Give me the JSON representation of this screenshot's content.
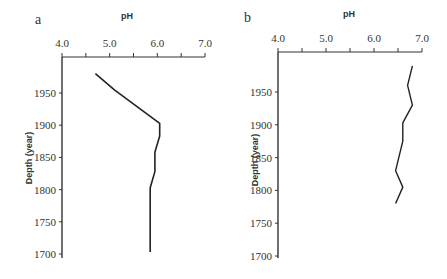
{
  "chart_data": [
    {
      "type": "line",
      "panel_label": "a",
      "title": "",
      "xlabel": "pH",
      "ylabel": "Depth (year)",
      "xlim": [
        4.0,
        7.0
      ],
      "ylim": [
        1700,
        1990
      ],
      "x_ticks": [
        "4.0",
        "5.0",
        "6.0",
        "7.0"
      ],
      "y_ticks": [
        "1950",
        "1900",
        "1850",
        "1800",
        "1750",
        "1700"
      ],
      "grid": false,
      "legend": null,
      "series": [
        {
          "name": "pH profile a",
          "points": [
            {
              "pH": 4.7,
              "year": 1980
            },
            {
              "pH": 5.1,
              "year": 1955
            },
            {
              "pH": 6.05,
              "year": 1903
            },
            {
              "pH": 6.05,
              "year": 1883
            },
            {
              "pH": 5.95,
              "year": 1858
            },
            {
              "pH": 5.95,
              "year": 1828
            },
            {
              "pH": 5.85,
              "year": 1803
            },
            {
              "pH": 5.85,
              "year": 1703
            }
          ]
        }
      ]
    },
    {
      "type": "line",
      "panel_label": "b",
      "title": "",
      "xlabel": "pH",
      "ylabel": "Depth (year)",
      "xlim": [
        4.0,
        7.0
      ],
      "ylim": [
        1700,
        1990
      ],
      "x_ticks": [
        "4.0",
        "5.0",
        "6.0",
        "7.0"
      ],
      "y_ticks": [
        "1950",
        "1900",
        "1850",
        "1800",
        "1750",
        "1700"
      ],
      "grid": false,
      "legend": null,
      "series": [
        {
          "name": "pH profile b",
          "points": [
            {
              "pH": 6.8,
              "year": 1990
            },
            {
              "pH": 6.7,
              "year": 1960
            },
            {
              "pH": 6.8,
              "year": 1930
            },
            {
              "pH": 6.6,
              "year": 1903
            },
            {
              "pH": 6.6,
              "year": 1875
            },
            {
              "pH": 6.45,
              "year": 1830
            },
            {
              "pH": 6.6,
              "year": 1805
            },
            {
              "pH": 6.45,
              "year": 1780
            }
          ]
        }
      ]
    }
  ],
  "panels": {
    "a": {
      "label": "a",
      "xlabel": "pH",
      "ylabel": "Depth (year)"
    },
    "b": {
      "label": "b",
      "xlabel": "pH",
      "ylabel": "Depth (year)"
    }
  },
  "colors": {
    "axis": "#333333",
    "line": "#222222"
  }
}
